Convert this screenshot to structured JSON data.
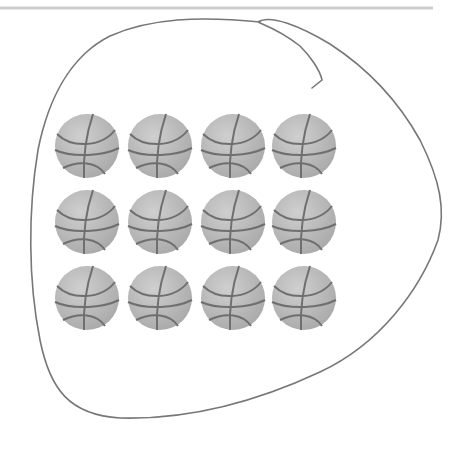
{
  "figure": {
    "top_rule": {
      "x1": 0,
      "x2": 433,
      "y": 8,
      "color": "#c8c8c8"
    },
    "loop": {
      "stroke": "#777777"
    },
    "ball": {
      "radius": 32,
      "fill": "#bdbdbd",
      "seam": "#6f6f6f"
    },
    "rows": 3,
    "cols": 4,
    "total": 12,
    "row_centers": [
      146,
      222,
      298
    ],
    "col_centers": [
      87,
      160,
      233,
      304
    ]
  }
}
